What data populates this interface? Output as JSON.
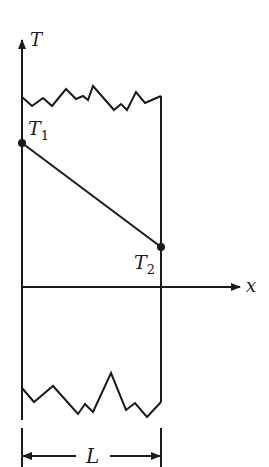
{
  "diagram": {
    "type": "temperature-profile-slab",
    "colors": {
      "ink": "#1a1a1a",
      "background": "#ffffff"
    },
    "axes": {
      "y_label": "T",
      "x_label": "x"
    },
    "points": [
      {
        "label": "T",
        "subscript": "1",
        "position": "left face"
      },
      {
        "label": "T",
        "subscript": "2",
        "position": "right face"
      }
    ],
    "dimension": {
      "label": "L"
    }
  }
}
